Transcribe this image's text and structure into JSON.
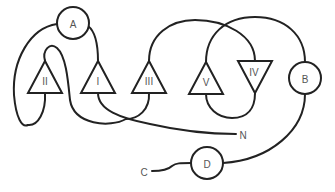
{
  "diagram": {
    "type": "knot-strand-diagram",
    "stroke_color": "#222222",
    "label_color": "#555555",
    "background": "#ffffff",
    "circles": [
      {
        "id": "A",
        "label": "A"
      },
      {
        "id": "B",
        "label": "B"
      },
      {
        "id": "D",
        "label": "D"
      }
    ],
    "triangles": [
      {
        "id": "II",
        "label": "II",
        "orientation": "up"
      },
      {
        "id": "I",
        "label": "I",
        "orientation": "up"
      },
      {
        "id": "III",
        "label": "III",
        "orientation": "up"
      },
      {
        "id": "V",
        "label": "V",
        "orientation": "up"
      },
      {
        "id": "IV",
        "label": "IV",
        "orientation": "down"
      }
    ],
    "endpoints": [
      {
        "id": "N",
        "label": "N"
      },
      {
        "id": "C",
        "label": "C"
      }
    ]
  }
}
